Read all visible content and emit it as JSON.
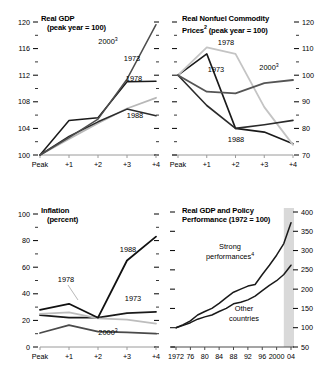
{
  "figure": {
    "panels": [
      {
        "id": "real-gdp",
        "title_line1": "Real GDP",
        "title_line2": "(peak year = 100)",
        "superscript": ""
      },
      {
        "id": "real-nonfuel-commodity-prices",
        "title_line1": "Real Nonfuel Commodity",
        "title_line2": "Prices",
        "title_line2_tail": " (peak year = 100)",
        "superscript": "2"
      },
      {
        "id": "inflation",
        "title_line1": "Inflation",
        "title_line2": "(percent)",
        "superscript": ""
      },
      {
        "id": "real-gdp-and-policy-performance",
        "title_line1": "Real GDP and Policy",
        "title_line2": "Performance (1972 = 100)",
        "superscript": ""
      }
    ]
  },
  "chart_data": [
    {
      "id": "real-gdp",
      "type": "line",
      "title": "Real GDP (peak year = 100)",
      "xlabel": "",
      "ylabel": "",
      "x": [
        "Peak",
        "+1",
        "+2",
        "+3",
        "+4"
      ],
      "xticklabels": [
        "Peak",
        "+1",
        "+2",
        "+3",
        "+4"
      ],
      "yticklabels": [
        "100",
        "104",
        "108",
        "112",
        "116",
        "120"
      ],
      "ylim": [
        100,
        120
      ],
      "ytickstep": 4,
      "yminorstep": 2,
      "grid": false,
      "legend": "inline-annotations",
      "series": [
        {
          "name": "1973",
          "label": "1973",
          "color": "#1a1a1a",
          "width": 1.5,
          "values": [
            100.0,
            105.2,
            105.6,
            111.0,
            111.1
          ]
        },
        {
          "name": "1978",
          "label": "1978",
          "color": "#b8b8b8",
          "width": 1.8,
          "values": [
            100.0,
            102.4,
            104.8,
            107.0,
            108.6
          ]
        },
        {
          "name": "1988",
          "label": "1988",
          "color": "#2b2b2b",
          "width": 1.5,
          "values": [
            100.0,
            102.8,
            105.0,
            106.9,
            105.9
          ]
        },
        {
          "name": "2000",
          "label": "2000",
          "label_sup": "3",
          "color": "#4d4d4d",
          "width": 1.5,
          "values": [
            100.0,
            102.6,
            105.4,
            111.4,
            119.6
          ]
        }
      ]
    },
    {
      "id": "real-nonfuel-commodity-prices",
      "type": "line",
      "title": "Real Nonfuel Commodity Prices (peak year = 100)",
      "title_superscript": "2",
      "xlabel": "",
      "ylabel": "",
      "x": [
        "Peak",
        "+1",
        "+2",
        "+3",
        "+4"
      ],
      "xticklabels": [
        "Peak",
        "+1",
        "+2",
        "+3",
        "+4"
      ],
      "yticklabels": [
        "70",
        "80",
        "90",
        "100",
        "110",
        "120"
      ],
      "ylim": [
        70,
        120
      ],
      "ytickstep": 10,
      "yminorstep": 5,
      "grid": false,
      "legend": "inline-annotations",
      "series": [
        {
          "name": "1973",
          "label": "1973",
          "color": "#1a1a1a",
          "width": 1.6,
          "values": [
            100.0,
            108.0,
            80.0,
            78.6,
            74.2
          ]
        },
        {
          "name": "1978",
          "label": "1978",
          "color": "#c4c4c4",
          "width": 1.8,
          "values": [
            100.0,
            110.5,
            108.0,
            88.0,
            73.8
          ]
        },
        {
          "name": "1988",
          "label": "1988",
          "color": "#2b2b2b",
          "width": 1.6,
          "values": [
            100.0,
            88.6,
            80.0,
            81.4,
            83.0
          ]
        },
        {
          "name": "2000",
          "label": "2000",
          "label_sup": "3",
          "color": "#555555",
          "width": 1.8,
          "values": [
            100.0,
            93.8,
            93.2,
            97.0,
            98.2
          ]
        }
      ]
    },
    {
      "id": "inflation",
      "type": "line",
      "title": "Inflation (percent)",
      "xlabel": "",
      "ylabel": "percent",
      "x": [
        "Peak",
        "+1",
        "+2",
        "+3",
        "+4"
      ],
      "xticklabels": [
        "Peak",
        "+1",
        "+2",
        "+3",
        "+4"
      ],
      "yticklabels": [
        "0",
        "20",
        "40",
        "60",
        "80",
        "100"
      ],
      "ylim": [
        0,
        100
      ],
      "ytickstep": 20,
      "yminorstep": 10,
      "grid": false,
      "legend": "inline-annotations",
      "series": [
        {
          "name": "1973",
          "label": "1973",
          "color": "#1a1a1a",
          "width": 1.8,
          "values": [
            24.0,
            22.0,
            22.0,
            25.5,
            26.5
          ]
        },
        {
          "name": "1978",
          "label": "1978",
          "color": "#bdbdbd",
          "width": 1.8,
          "values": [
            25.0,
            26.0,
            21.5,
            20.5,
            17.5
          ]
        },
        {
          "name": "1988",
          "label": "1988",
          "color": "#111111",
          "width": 1.8,
          "values": [
            28.0,
            32.5,
            22.0,
            65.0,
            83.0
          ]
        },
        {
          "name": "2000",
          "label": "2000",
          "label_sup": "3",
          "color": "#4a4a4a",
          "width": 1.8,
          "values": [
            10.5,
            16.5,
            11.5,
            11.0,
            10.0
          ]
        }
      ]
    },
    {
      "id": "real-gdp-and-policy-performance",
      "type": "line",
      "title": "Real GDP and Policy Performance (1972 = 100)",
      "xlabel": "",
      "ylabel": "",
      "x": [
        1972,
        1974,
        1976,
        1978,
        1980,
        1982,
        1984,
        1986,
        1988,
        1990,
        1992,
        1994,
        1996,
        1998,
        2000,
        2002,
        2004
      ],
      "xticklabels": [
        "1972",
        "76",
        "80",
        "84",
        "88",
        "92",
        "96",
        "2000",
        "04"
      ],
      "yticklabels": [
        "50",
        "100",
        "150",
        "200",
        "250",
        "300",
        "350",
        "400"
      ],
      "ylim": [
        50,
        400
      ],
      "ytickstep": 50,
      "grid": false,
      "shaded_forecast_from": 2002,
      "legend": "inline-annotations",
      "series": [
        {
          "name": "Strong performances",
          "label": "Strong",
          "label2": "performances",
          "label_sup": "4",
          "color": "#1a1a1a",
          "width": 1.5,
          "values": [
            100,
            108,
            118,
            133,
            142,
            150,
            163,
            178,
            192,
            200,
            208,
            212,
            238,
            262,
            288,
            318,
            372
          ]
        },
        {
          "name": "Other countries",
          "label": "Other",
          "label2": "countries",
          "color": "#1a1a1a",
          "width": 1.5,
          "values": [
            100,
            106,
            113,
            122,
            128,
            133,
            142,
            150,
            162,
            166,
            172,
            182,
            196,
            210,
            222,
            238,
            262
          ]
        }
      ]
    }
  ]
}
